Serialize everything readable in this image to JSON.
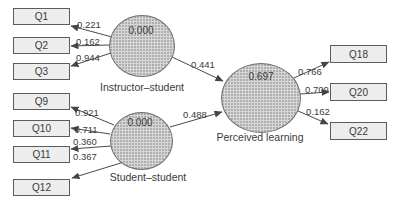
{
  "figure": {
    "type": "sem-path-diagram",
    "background": "#ffffff",
    "latent_nodes": [
      {
        "name": "Instructor–student",
        "value": "0.000"
      },
      {
        "name": "Student–student",
        "value": "0.000"
      },
      {
        "name": "Perceived learning",
        "value": "0.697"
      }
    ],
    "observed_nodes": [
      "Q1",
      "Q2",
      "Q3",
      "Q9",
      "Q10",
      "Q11",
      "Q12",
      "Q18",
      "Q20",
      "Q22"
    ],
    "paths": [
      {
        "from": "Instructor–student",
        "to": "Q1",
        "value": "0.221"
      },
      {
        "from": "Instructor–student",
        "to": "Q2",
        "value": "0.162"
      },
      {
        "from": "Instructor–student",
        "to": "Q3",
        "value": "0.944"
      },
      {
        "from": "Student–student",
        "to": "Q9",
        "value": "0.921"
      },
      {
        "from": "Student–student",
        "to": "Q10",
        "value": "0.711"
      },
      {
        "from": "Student–student",
        "to": "Q11",
        "value": "0.360"
      },
      {
        "from": "Student–student",
        "to": "Q12",
        "value": "0.367"
      },
      {
        "from": "Instructor–student",
        "to": "Perceived learning",
        "value": "0.441"
      },
      {
        "from": "Student–student",
        "to": "Perceived learning",
        "value": "0.488"
      },
      {
        "from": "Perceived learning",
        "to": "Q18",
        "value": "0.766"
      },
      {
        "from": "Perceived learning",
        "to": "Q20",
        "value": "0.709"
      },
      {
        "from": "Perceived learning",
        "to": "Q22",
        "value": "0.162"
      }
    ],
    "colors": {
      "box_fill": "#ededed",
      "box_border": "#5c5c5c",
      "latent_fill": "#d7d7d7",
      "latent_dot": "#a3a3a3",
      "latent_border": "#6e6e6e",
      "arrow": "#454545",
      "text": "#3a3a3a",
      "background": "#ffffff"
    }
  }
}
